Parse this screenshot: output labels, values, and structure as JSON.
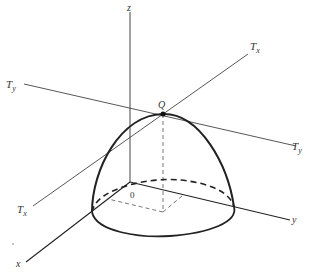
{
  "figure": {
    "type": "3d-surface-diagram",
    "colors": {
      "background": "#ffffff",
      "ink": "#222222",
      "thin_line": "#444444",
      "dashed": "#555555"
    },
    "labels": {
      "z_axis": "z",
      "x_axis": "x",
      "y_axis": "y",
      "origin": "0",
      "apex_point": "Q",
      "tangent_x_top": "T",
      "tangent_x_top_sub": "x",
      "tangent_x_bottom": "T",
      "tangent_x_bottom_sub": "x",
      "tangent_y_left": "T",
      "tangent_y_left_sub": "y",
      "tangent_y_right": "T",
      "tangent_y_right_sub": "y"
    },
    "axes": {
      "origin": [
        130,
        182
      ],
      "z_end": [
        130,
        10
      ],
      "x_end": [
        26,
        262
      ],
      "y_end": [
        290,
        220
      ]
    },
    "tangent_lines": {
      "Tx": {
        "start": [
          32,
          205
        ],
        "end": [
          248,
          54
        ]
      },
      "Ty": {
        "start": [
          24,
          84
        ],
        "end": [
          296,
          146
        ]
      }
    },
    "apex": [
      163,
      114
    ]
  }
}
